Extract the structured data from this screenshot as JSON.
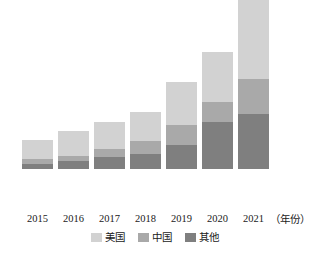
{
  "chart_data": {
    "type": "bar",
    "variant": "stacked-vertical",
    "title": "",
    "subtitle": "",
    "xlabel": "年份",
    "xlabel_display": "（年份）",
    "ylabel": "",
    "grid": false,
    "axis_line": false,
    "y_tick_labels": [],
    "ylim": [
      0,
      100
    ],
    "legend_position": "bottom-center",
    "categories": [
      "2015",
      "2016",
      "2017",
      "2018",
      "2019",
      "2020",
      "2021"
    ],
    "stack_order_bottom_to_top": [
      "其他",
      "中国",
      "美国"
    ],
    "series": [
      {
        "name": "美国",
        "color": "#d2d2d2",
        "values": [
          9.7,
          12.8,
          13.8,
          14.9,
          22.1,
          25.6,
          53.8
        ]
      },
      {
        "name": "中国",
        "color": "#a9a9a9",
        "values": [
          2.6,
          2.6,
          4.1,
          6.7,
          10.3,
          10.3,
          17.9
        ]
      },
      {
        "name": "其他",
        "color": "#7f7f7f",
        "values": [
          2.6,
          4.1,
          6.2,
          7.7,
          12.3,
          24.1,
          28.2
        ]
      }
    ],
    "totals": [
      14.9,
      19.5,
      24.1,
      29.3,
      44.7,
      60.0,
      99.9
    ]
  },
  "axis": {
    "unit_suffix": "（年份）",
    "ticks": [
      {
        "label": "2015"
      },
      {
        "label": "2016"
      },
      {
        "label": "2017"
      },
      {
        "label": "2018"
      },
      {
        "label": "2019"
      },
      {
        "label": "2020"
      },
      {
        "label": "2021"
      }
    ]
  },
  "legend": {
    "items": [
      {
        "label": "美国",
        "color": "#d2d2d2"
      },
      {
        "label": "中国",
        "color": "#a9a9a9"
      },
      {
        "label": "其他",
        "color": "#7f7f7f"
      }
    ]
  },
  "layout": {
    "bar_width_px": 31,
    "bar_gap_px": 5,
    "plot_left_px": 22,
    "baseline_y_px": 210,
    "max_bar_height_px": 195,
    "value_scale_max": 100
  },
  "colors": {
    "background": "#ffffff",
    "text": "#1a1a1a",
    "us": "#d2d2d2",
    "china": "#a9a9a9",
    "other": "#7f7f7f"
  }
}
